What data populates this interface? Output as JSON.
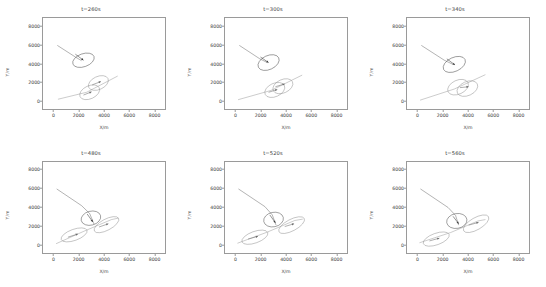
{
  "figure": {
    "background": "#ffffff",
    "rows": 2,
    "cols": 3,
    "axis_color": "#9a9a9a",
    "text_color": "#3c3c3c"
  },
  "chart_data": [
    {
      "type": "scatter",
      "title": "t=260s",
      "xlabel": "X/m",
      "ylabel": "Y/m",
      "xlim": [
        -900,
        8900
      ],
      "ylim": [
        -900,
        8900
      ],
      "xticks": [
        0,
        2000,
        4000,
        6000,
        8000
      ],
      "yticks": [
        0,
        2000,
        4000,
        6000,
        8000
      ],
      "xticklabels": [
        "0",
        "2000",
        "4000",
        "6000",
        "8000"
      ],
      "yticklabels": [
        "0",
        "2000",
        "4000",
        "6000",
        "8000"
      ],
      "grid": false,
      "legend": null,
      "series": [
        {
          "name": "trajectory-1",
          "type": "line",
          "color": "#555555",
          "points": [
            [
              250,
              5950
            ],
            [
              1700,
              4700
            ],
            [
              2200,
              4300
            ]
          ]
        },
        {
          "name": "trajectory-2",
          "type": "line",
          "color": "#8a8a8a",
          "points": [
            [
              300,
              150
            ],
            [
              2600,
              900
            ],
            [
              5100,
              2650
            ]
          ]
        },
        {
          "name": "ellipse-1",
          "type": "ellipse",
          "color": "#3a3a3a",
          "cx": 2350,
          "cy": 4350,
          "rx": 900,
          "ry": 700,
          "angle": -20
        },
        {
          "name": "ellipse-2",
          "type": "ellipse",
          "color": "#8a8a8a",
          "cx": 3550,
          "cy": 1900,
          "rx": 850,
          "ry": 700,
          "angle": -25
        },
        {
          "name": "ellipse-3",
          "type": "ellipse",
          "color": "#8a8a8a",
          "cx": 2850,
          "cy": 900,
          "rx": 850,
          "ry": 700,
          "angle": -25
        },
        {
          "name": "arrow-1",
          "type": "arrow",
          "color": "#3a3a3a",
          "x0": 1700,
          "y0": 5000,
          "x1": 2350,
          "y1": 4350
        },
        {
          "name": "arrow-2",
          "type": "arrow",
          "color": "#6a6a6a",
          "x0": 3050,
          "y0": 1700,
          "x1": 3750,
          "y1": 2050
        },
        {
          "name": "arrow-3",
          "type": "arrow",
          "color": "#6a6a6a",
          "x0": 2350,
          "y0": 600,
          "x1": 3000,
          "y1": 950
        }
      ]
    },
    {
      "type": "scatter",
      "title": "t=300s",
      "xlabel": "X/m",
      "ylabel": "Y/m",
      "xlim": [
        -900,
        8900
      ],
      "ylim": [
        -900,
        8900
      ],
      "xticks": [
        0,
        2000,
        4000,
        6000,
        8000
      ],
      "yticks": [
        0,
        2000,
        4000,
        6000,
        8000
      ],
      "xticklabels": [
        "0",
        "2000",
        "4000",
        "6000",
        "8000"
      ],
      "yticklabels": [
        "0",
        "2000",
        "4000",
        "6000",
        "8000"
      ],
      "grid": false,
      "legend": null,
      "series": [
        {
          "name": "trajectory-1",
          "type": "line",
          "color": "#555555",
          "points": [
            [
              250,
              5950
            ],
            [
              1900,
              4500
            ],
            [
              2500,
              4100
            ]
          ]
        },
        {
          "name": "trajectory-2",
          "type": "line",
          "color": "#8a8a8a",
          "points": [
            [
              150,
              100
            ],
            [
              2800,
              1100
            ],
            [
              5300,
              2750
            ]
          ]
        },
        {
          "name": "ellipse-1",
          "type": "ellipse",
          "color": "#3a3a3a",
          "cx": 2600,
          "cy": 4100,
          "rx": 900,
          "ry": 750,
          "angle": -25
        },
        {
          "name": "ellipse-2",
          "type": "ellipse",
          "color": "#8a8a8a",
          "cx": 3750,
          "cy": 1550,
          "rx": 850,
          "ry": 720,
          "angle": -25
        },
        {
          "name": "ellipse-3",
          "type": "ellipse",
          "color": "#8a8a8a",
          "cx": 3100,
          "cy": 1150,
          "rx": 850,
          "ry": 720,
          "angle": -25
        },
        {
          "name": "arrow-1",
          "type": "arrow",
          "color": "#3a3a3a",
          "x0": 1950,
          "y0": 4700,
          "x1": 2600,
          "y1": 4100
        },
        {
          "name": "arrow-2",
          "type": "arrow",
          "color": "#6a6a6a",
          "x0": 3150,
          "y0": 1500,
          "x1": 3900,
          "y1": 1800
        },
        {
          "name": "arrow-3",
          "type": "arrow",
          "color": "#6a6a6a",
          "x0": 2600,
          "y0": 900,
          "x1": 3300,
          "y1": 1200
        }
      ]
    },
    {
      "type": "scatter",
      "title": "t=340s",
      "xlabel": "X/m",
      "ylabel": "Y/m",
      "xlim": [
        -900,
        8900
      ],
      "ylim": [
        -900,
        8900
      ],
      "xticks": [
        0,
        2000,
        4000,
        6000,
        8000
      ],
      "yticks": [
        0,
        2000,
        4000,
        6000,
        8000
      ],
      "xticklabels": [
        "0",
        "2000",
        "4000",
        "6000",
        "8000"
      ],
      "yticklabels": [
        "0",
        "2000",
        "4000",
        "6000",
        "8000"
      ],
      "grid": false,
      "legend": null,
      "series": [
        {
          "name": "trajectory-1",
          "type": "line",
          "color": "#555555",
          "points": [
            [
              250,
              5950
            ],
            [
              2100,
              4350
            ],
            [
              2800,
              3900
            ]
          ]
        },
        {
          "name": "trajectory-2",
          "type": "line",
          "color": "#8a8a8a",
          "points": [
            [
              150,
              50
            ],
            [
              2900,
              1250
            ],
            [
              5400,
              2800
            ]
          ]
        },
        {
          "name": "ellipse-1",
          "type": "ellipse",
          "color": "#3a3a3a",
          "cx": 2900,
          "cy": 3900,
          "rx": 950,
          "ry": 750,
          "angle": -25
        },
        {
          "name": "ellipse-2",
          "type": "ellipse",
          "color": "#8a8a8a",
          "cx": 3950,
          "cy": 1300,
          "rx": 880,
          "ry": 750,
          "angle": -25
        },
        {
          "name": "ellipse-3",
          "type": "ellipse",
          "color": "#8a8a8a",
          "cx": 3200,
          "cy": 1450,
          "rx": 880,
          "ry": 750,
          "angle": -25
        },
        {
          "name": "arrow-1",
          "type": "arrow",
          "color": "#3a3a3a",
          "x0": 2300,
          "y0": 4500,
          "x1": 2950,
          "y1": 3850
        },
        {
          "name": "arrow-2",
          "type": "arrow",
          "color": "#6a6a6a",
          "x0": 3350,
          "y0": 1400,
          "x1": 4050,
          "y1": 1500
        }
      ]
    },
    {
      "type": "scatter",
      "title": "t=480s",
      "xlabel": "X/m",
      "ylabel": "Y/m",
      "xlim": [
        -900,
        8900
      ],
      "ylim": [
        -900,
        8900
      ],
      "xticks": [
        0,
        2000,
        4000,
        6000,
        8000
      ],
      "yticks": [
        0,
        2000,
        4000,
        6000,
        8000
      ],
      "xticklabels": [
        "0",
        "2000",
        "4000",
        "6000",
        "8000"
      ],
      "yticklabels": [
        "0",
        "2000",
        "4000",
        "6000",
        "8000"
      ],
      "grid": false,
      "legend": null,
      "series": [
        {
          "name": "trajectory-1",
          "type": "line",
          "color": "#555555",
          "points": [
            [
              200,
              6000
            ],
            [
              2200,
              4200
            ],
            [
              2850,
              3350
            ],
            [
              3200,
              2200
            ]
          ]
        },
        {
          "name": "trajectory-2",
          "type": "line",
          "color": "#8a8a8a",
          "points": [
            [
              150,
              100
            ],
            [
              2400,
              1450
            ],
            [
              4600,
              2700
            ],
            [
              5150,
              2850
            ]
          ]
        },
        {
          "name": "ellipse-1",
          "type": "ellipse",
          "color": "#3a3a3a",
          "cx": 2950,
          "cy": 2850,
          "rx": 800,
          "ry": 750,
          "angle": -15
        },
        {
          "name": "ellipse-2",
          "type": "ellipse",
          "color": "#8a8a8a",
          "cx": 4200,
          "cy": 2150,
          "rx": 1100,
          "ry": 600,
          "angle": -28
        },
        {
          "name": "ellipse-3",
          "type": "ellipse",
          "color": "#8a8a8a",
          "cx": 1600,
          "cy": 1050,
          "rx": 1100,
          "ry": 600,
          "angle": -20
        },
        {
          "name": "arrow-1",
          "type": "arrow",
          "color": "#3a3a3a",
          "x0": 2650,
          "y0": 3300,
          "x1": 3100,
          "y1": 2450
        },
        {
          "name": "arrow-2",
          "type": "arrow",
          "color": "#6a6a6a",
          "x0": 3600,
          "y0": 1900,
          "x1": 4350,
          "y1": 2250
        },
        {
          "name": "arrow-3",
          "type": "arrow",
          "color": "#6a6a6a",
          "x0": 1100,
          "y0": 800,
          "x1": 1900,
          "y1": 1150
        }
      ]
    },
    {
      "type": "scatter",
      "title": "t=520s",
      "xlabel": "X/m",
      "ylabel": "Y/m",
      "xlim": [
        -900,
        8900
      ],
      "ylim": [
        -900,
        8900
      ],
      "xticks": [
        0,
        2000,
        4000,
        6000,
        8000
      ],
      "yticks": [
        0,
        2000,
        4000,
        6000,
        8000
      ],
      "xticklabels": [
        "0",
        "2000",
        "4000",
        "6000",
        "8000"
      ],
      "yticklabels": [
        "0",
        "2000",
        "4000",
        "6000",
        "8000"
      ],
      "grid": false,
      "legend": null,
      "series": [
        {
          "name": "trajectory-1",
          "type": "line",
          "color": "#555555",
          "points": [
            [
              180,
              6000
            ],
            [
              2300,
              4100
            ],
            [
              2900,
              3200
            ],
            [
              3200,
              2100
            ]
          ]
        },
        {
          "name": "trajectory-2",
          "type": "line",
          "color": "#8a8a8a",
          "points": [
            [
              100,
              150
            ],
            [
              2500,
              1350
            ],
            [
              4700,
              2600
            ],
            [
              5350,
              2750
            ]
          ]
        },
        {
          "name": "ellipse-1",
          "type": "ellipse",
          "color": "#3a3a3a",
          "cx": 3000,
          "cy": 2700,
          "rx": 800,
          "ry": 780,
          "angle": -12
        },
        {
          "name": "ellipse-2",
          "type": "ellipse",
          "color": "#8a8a8a",
          "cx": 4450,
          "cy": 2100,
          "rx": 1150,
          "ry": 620,
          "angle": -28
        },
        {
          "name": "ellipse-3",
          "type": "ellipse",
          "color": "#8a8a8a",
          "cx": 1500,
          "cy": 800,
          "rx": 1100,
          "ry": 620,
          "angle": -20
        },
        {
          "name": "arrow-1",
          "type": "arrow",
          "color": "#3a3a3a",
          "x0": 2700,
          "y0": 3200,
          "x1": 3150,
          "y1": 2350
        },
        {
          "name": "arrow-2",
          "type": "arrow",
          "color": "#6a6a6a",
          "x0": 3900,
          "y0": 1950,
          "x1": 4650,
          "y1": 2250
        },
        {
          "name": "arrow-3",
          "type": "arrow",
          "color": "#6a6a6a",
          "x0": 950,
          "y0": 600,
          "x1": 1750,
          "y1": 900
        }
      ]
    },
    {
      "type": "scatter",
      "title": "t=560s",
      "xlabel": "X/m",
      "ylabel": "Y/m",
      "xlim": [
        -900,
        8900
      ],
      "ylim": [
        -900,
        8900
      ],
      "xticks": [
        0,
        2000,
        4000,
        6000,
        8000
      ],
      "yticks": [
        0,
        2000,
        4000,
        6000,
        8000
      ],
      "xticklabels": [
        "0",
        "2000",
        "4000",
        "6000",
        "8000"
      ],
      "yticklabels": [
        "0",
        "2000",
        "4000",
        "6000",
        "8000"
      ],
      "grid": false,
      "legend": null,
      "series": [
        {
          "name": "trajectory-1",
          "type": "line",
          "color": "#555555",
          "points": [
            [
              180,
              6000
            ],
            [
              2400,
              4000
            ],
            [
              3000,
              3150
            ],
            [
              3250,
              2100
            ]
          ]
        },
        {
          "name": "trajectory-2",
          "type": "line",
          "color": "#8a8a8a",
          "points": [
            [
              100,
              200
            ],
            [
              2600,
              1300
            ],
            [
              4800,
              2550
            ],
            [
              5400,
              2700
            ]
          ]
        },
        {
          "name": "ellipse-1",
          "type": "ellipse",
          "color": "#3a3a3a",
          "cx": 3100,
          "cy": 2550,
          "rx": 820,
          "ry": 800,
          "angle": -10
        },
        {
          "name": "ellipse-2",
          "type": "ellipse",
          "color": "#8a8a8a",
          "cx": 4650,
          "cy": 2250,
          "rx": 1150,
          "ry": 650,
          "angle": -30
        },
        {
          "name": "ellipse-3",
          "type": "ellipse",
          "color": "#8a8a8a",
          "cx": 1450,
          "cy": 600,
          "rx": 1100,
          "ry": 620,
          "angle": -20
        },
        {
          "name": "arrow-1",
          "type": "arrow",
          "color": "#3a3a3a",
          "x0": 2800,
          "y0": 3050,
          "x1": 3250,
          "y1": 2250
        },
        {
          "name": "arrow-2",
          "type": "arrow",
          "color": "#6a6a6a",
          "x0": 4050,
          "y0": 2100,
          "x1": 4850,
          "y1": 2400
        },
        {
          "name": "arrow-3",
          "type": "arrow",
          "color": "#6a6a6a",
          "x0": 900,
          "y0": 400,
          "x1": 1700,
          "y1": 700
        }
      ]
    }
  ]
}
